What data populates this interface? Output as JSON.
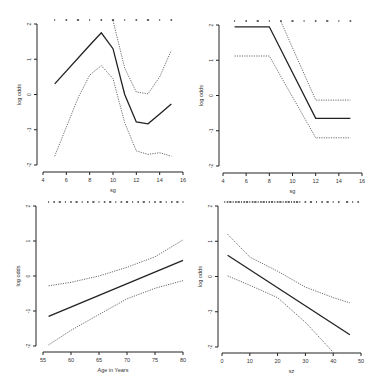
{
  "chart_data": [
    {
      "type": "line",
      "title": "",
      "xlabel": "sg",
      "ylabel": "log odds",
      "xlim": [
        4,
        16
      ],
      "ylim": [
        -2,
        2
      ],
      "xticks": [
        4,
        6,
        8,
        10,
        12,
        14,
        16
      ],
      "yticks": [
        -2,
        -1,
        0,
        1,
        2
      ],
      "grid": false,
      "rug": [
        5,
        6,
        7,
        8,
        9,
        10,
        11,
        12,
        13,
        14,
        15
      ],
      "series": [
        {
          "name": "estimate",
          "style": "solid",
          "x": [
            5,
            8,
            9,
            10,
            11,
            12,
            13,
            14,
            15
          ],
          "values": [
            0.3,
            1.4,
            1.75,
            1.3,
            0.0,
            -0.78,
            -0.83,
            -0.55,
            -0.27
          ]
        },
        {
          "name": "upper CI",
          "style": "dotted",
          "x": [
            10,
            11,
            12,
            13,
            14,
            15
          ],
          "values": [
            2.1,
            0.75,
            0.07,
            0.02,
            0.5,
            1.25
          ]
        },
        {
          "name": "lower CI",
          "style": "dotted",
          "x": [
            5,
            7,
            8,
            9,
            10,
            11,
            12,
            13,
            14,
            15
          ],
          "values": [
            -1.75,
            -0.1,
            0.55,
            0.82,
            0.45,
            -0.8,
            -1.6,
            -1.7,
            -1.65,
            -1.75
          ]
        }
      ]
    },
    {
      "type": "line",
      "title": "",
      "xlabel": "sg",
      "ylabel": "log odds",
      "xlim": [
        4,
        16
      ],
      "ylim": [
        -2,
        2
      ],
      "xticks": [
        4,
        6,
        8,
        10,
        12,
        14,
        16
      ],
      "yticks": [
        -2,
        -1,
        0,
        1,
        2
      ],
      "grid": false,
      "rug": [
        5,
        6,
        7,
        8,
        9,
        10,
        11,
        12,
        13,
        14,
        15
      ],
      "series": [
        {
          "name": "estimate",
          "style": "solid",
          "x": [
            5,
            8,
            12,
            15
          ],
          "values": [
            1.95,
            1.95,
            -0.65,
            -0.65
          ]
        },
        {
          "name": "upper CI",
          "style": "dotted",
          "x": [
            9,
            12,
            15
          ],
          "values": [
            2.1,
            -0.13,
            -0.13
          ]
        },
        {
          "name": "lower CI",
          "style": "dotted",
          "x": [
            5,
            8,
            12,
            15
          ],
          "values": [
            1.12,
            1.12,
            -1.2,
            -1.2
          ]
        }
      ]
    },
    {
      "type": "line",
      "title": "",
      "xlabel": "Age in Years",
      "ylabel": "log odds",
      "xlim": [
        55,
        80
      ],
      "ylim": [
        -2,
        2
      ],
      "xticks": [
        55,
        60,
        65,
        70,
        75,
        80
      ],
      "yticks": [
        -2,
        -1,
        0,
        1,
        2
      ],
      "grid": false,
      "rug": [
        56,
        57,
        58,
        59,
        60,
        61,
        62,
        63,
        64,
        65,
        66,
        67,
        68,
        69,
        70,
        71,
        72,
        73,
        74,
        75,
        76,
        77,
        78,
        79,
        80
      ],
      "series": [
        {
          "name": "estimate",
          "style": "solid",
          "x": [
            56,
            80
          ],
          "values": [
            -1.15,
            0.45
          ]
        },
        {
          "name": "upper CI",
          "style": "dotted",
          "x": [
            56,
            60,
            65,
            70,
            75,
            80
          ],
          "values": [
            -0.28,
            -0.18,
            0.0,
            0.25,
            0.55,
            1.03
          ]
        },
        {
          "name": "lower CI",
          "style": "dotted",
          "x": [
            56,
            60,
            65,
            70,
            75,
            80
          ],
          "values": [
            -1.97,
            -1.55,
            -1.1,
            -0.65,
            -0.35,
            -0.13
          ]
        }
      ]
    },
    {
      "type": "line",
      "title": "",
      "xlabel": "sz",
      "ylabel": "log odds",
      "xlim": [
        0,
        50
      ],
      "ylim": [
        -2,
        2
      ],
      "xticks": [
        0,
        10,
        20,
        30,
        40,
        50
      ],
      "yticks": [
        -2,
        -1,
        0,
        1,
        2
      ],
      "grid": false,
      "rug": [
        1,
        2,
        3,
        4,
        5,
        6,
        7,
        8,
        9,
        10,
        11,
        12,
        13,
        14,
        15,
        16,
        17,
        18,
        19,
        20,
        21,
        22,
        23,
        24,
        25,
        26,
        27,
        28,
        30,
        32,
        34,
        36,
        38,
        40,
        42,
        45,
        47,
        49
      ],
      "series": [
        {
          "name": "estimate",
          "style": "solid",
          "x": [
            2,
            46
          ],
          "values": [
            0.6,
            -1.65
          ]
        },
        {
          "name": "upper CI",
          "style": "dotted",
          "x": [
            2,
            10,
            20,
            30,
            40,
            46
          ],
          "values": [
            1.2,
            0.55,
            0.15,
            -0.3,
            -0.6,
            -0.75
          ]
        },
        {
          "name": "lower CI",
          "style": "dotted",
          "x": [
            2,
            10,
            20,
            30,
            40
          ],
          "values": [
            0.02,
            -0.25,
            -0.6,
            -1.3,
            -2.15
          ]
        }
      ]
    }
  ],
  "panels_layout": [
    {
      "axis_x": 37,
      "x0": 43,
      "x1": 183,
      "y_top": 24,
      "y_bot": 165,
      "axis_y": 172
    },
    {
      "axis_x": 219,
      "x0": 223,
      "x1": 362,
      "y_top": 25,
      "y_bot": 166,
      "axis_y": 173
    },
    {
      "axis_x": 36,
      "x0": 43,
      "x1": 183,
      "y_top": 206,
      "y_bot": 346,
      "axis_y": 352
    },
    {
      "axis_x": 218,
      "x0": 222,
      "x1": 361,
      "y_top": 206,
      "y_bot": 347,
      "axis_y": 353
    }
  ],
  "colors": {
    "line": "#222222",
    "ci": "#444444",
    "axis": "#222222",
    "rug": "#333333"
  }
}
